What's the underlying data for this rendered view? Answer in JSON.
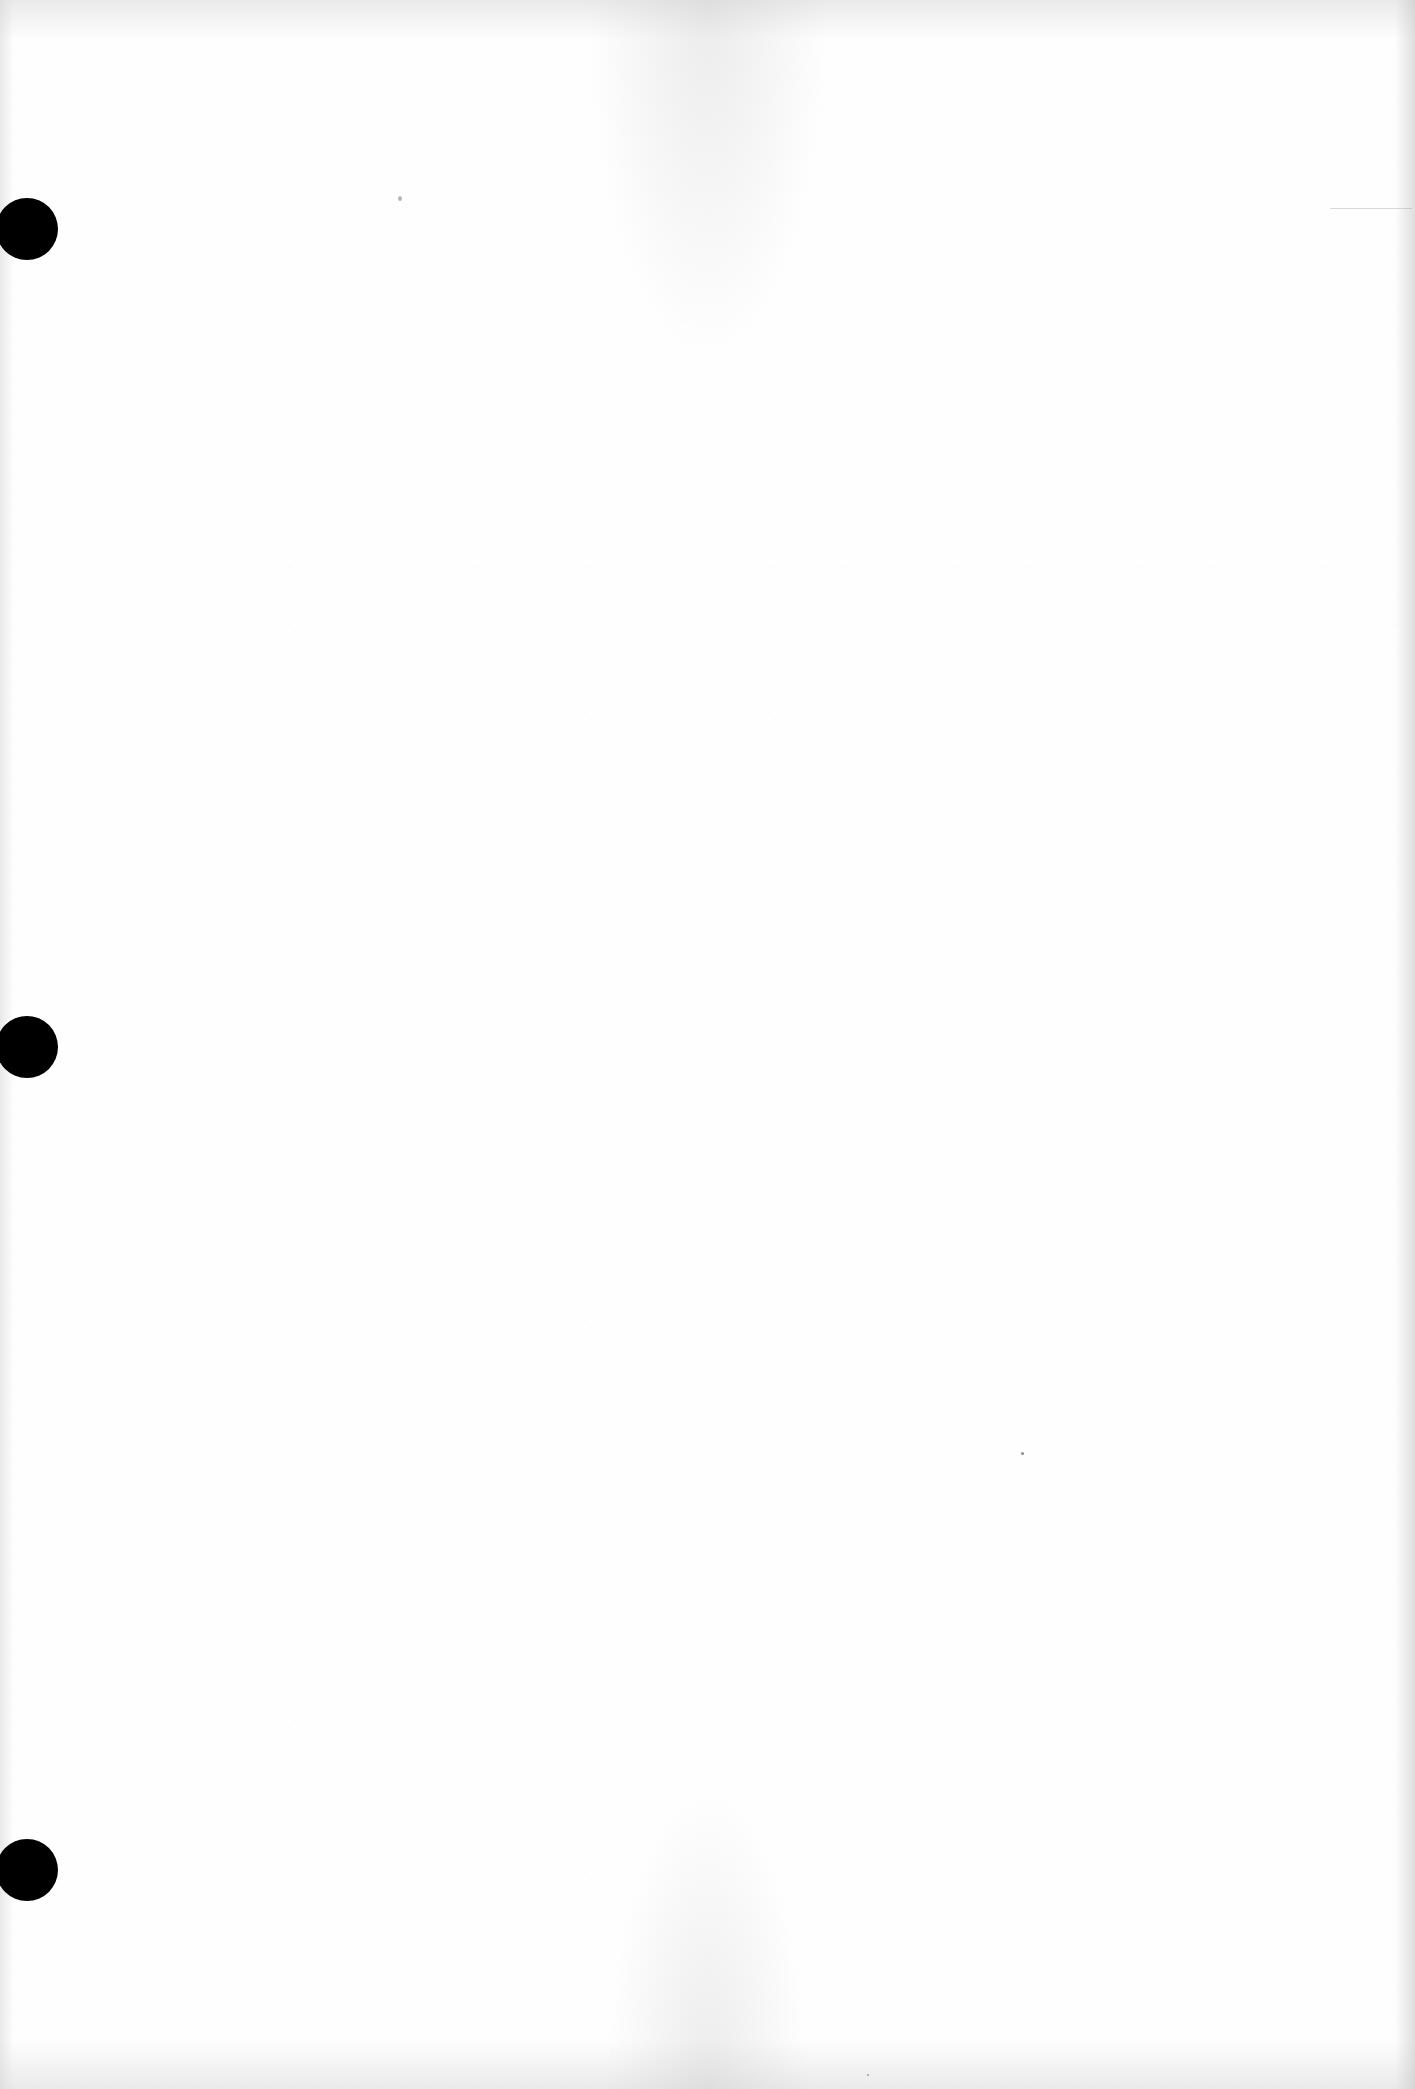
{
  "document": {
    "type": "blank scanned page",
    "text": "",
    "background_color": "#fefefe",
    "punch_holes": {
      "count": 3,
      "color": "#000000",
      "positions": [
        {
          "name": "top",
          "center_y": 228
        },
        {
          "name": "middle",
          "center_y": 1047
        },
        {
          "name": "bottom",
          "center_y": 1870
        }
      ]
    }
  }
}
